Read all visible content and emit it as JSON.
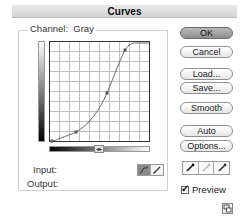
{
  "window": {
    "title": "Curves"
  },
  "channel": {
    "label": "Channel:",
    "value": "Gray"
  },
  "graph": {
    "grid_divisions": 10,
    "curve_points": [
      {
        "x": 2,
        "y": 99
      },
      {
        "x": 26,
        "y": 90
      },
      {
        "x": 57,
        "y": 51
      },
      {
        "x": 75,
        "y": 8
      }
    ]
  },
  "fields": {
    "input_label": "Input:",
    "output_label": "Output:"
  },
  "buttons": {
    "ok": "OK",
    "cancel": "Cancel",
    "load": "Load...",
    "save": "Save...",
    "smooth": "Smooth",
    "auto": "Auto",
    "options": "Options..."
  },
  "preview": {
    "label": "Preview",
    "checked": true
  },
  "icons": {
    "curve_tool": "curve-tool-icon",
    "pencil_tool": "pencil-icon",
    "black_eyedropper": "eyedropper-black-icon",
    "gray_eyedropper": "eyedropper-gray-icon",
    "white_eyedropper": "eyedropper-white-icon",
    "expand": "expand-graph-icon",
    "swap_gradient": "swap-gradient-icon"
  }
}
